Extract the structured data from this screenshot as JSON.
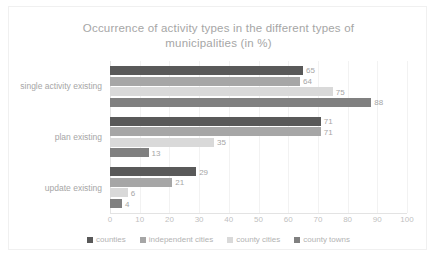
{
  "chart_data": {
    "type": "bar",
    "orientation": "horizontal",
    "title": "Occurrence of activity types in the different types of\nmunicipalities (in %)",
    "xlabel": "",
    "ylabel": "",
    "xlim": [
      0,
      100
    ],
    "xticks": [
      "0",
      "10",
      "20",
      "30",
      "40",
      "50",
      "60",
      "70",
      "80",
      "90",
      "100"
    ],
    "grid": true,
    "legend_position": "bottom",
    "categories": [
      "single activity existing",
      "plan existing",
      "update existing"
    ],
    "series": [
      {
        "name": "counties",
        "color": "#595959",
        "values": [
          65,
          71,
          29
        ]
      },
      {
        "name": "independent cities",
        "color": "#a6a6a6",
        "values": [
          64,
          71,
          21
        ]
      },
      {
        "name": "county cities",
        "color": "#d9d9d9",
        "values": [
          75,
          35,
          6
        ]
      },
      {
        "name": "county towns",
        "color": "#808080",
        "values": [
          88,
          13,
          4
        ]
      }
    ]
  }
}
